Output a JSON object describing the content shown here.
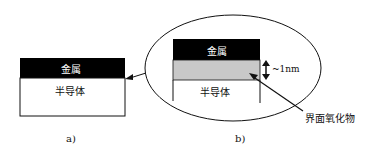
{
  "diagram": {
    "panel_a": {
      "metal_label": "金属",
      "semiconductor_label": "半导体",
      "caption": "a)"
    },
    "panel_b": {
      "metal_label": "金属",
      "semiconductor_label": "半导体",
      "thickness_label": "~1nm",
      "oxide_label": "界面氧化物",
      "caption": "b)"
    },
    "colors": {
      "metal": "#000000",
      "oxide": "#c8c8c8",
      "semiconductor": "#ffffff",
      "line": "#111111"
    }
  }
}
